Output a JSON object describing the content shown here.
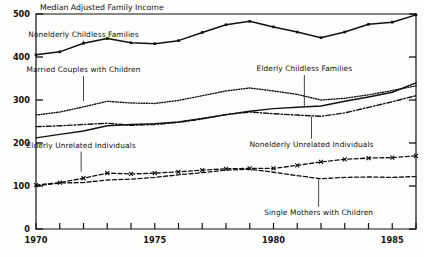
{
  "chart_data": {
    "type": "line",
    "title": "Median Adjusted Family Income",
    "xlabel": "",
    "ylabel": "",
    "xlim": [
      1970,
      1986
    ],
    "ylim": [
      0,
      500
    ],
    "grid": false,
    "legend": "inline-annotations",
    "yticks": [
      0,
      100,
      200,
      300,
      400,
      500
    ],
    "xticks": [
      1970,
      1971,
      1972,
      1973,
      1974,
      1975,
      1976,
      1977,
      1978,
      1979,
      1980,
      1981,
      1982,
      1983,
      1984,
      1985,
      1986
    ],
    "xtick_labels": [
      "1970",
      "1975",
      "1980",
      "1985"
    ],
    "xtick_labeled_years": [
      1970,
      1975,
      1980,
      1985
    ],
    "x": [
      1970,
      1971,
      1972,
      1973,
      1974,
      1975,
      1976,
      1977,
      1978,
      1979,
      1980,
      1981,
      1982,
      1983,
      1984,
      1985,
      1986
    ],
    "series": [
      {
        "name": "Nonelderly Childless Families",
        "style": "solid-markers",
        "color": "#111111",
        "values": [
          405,
          412,
          432,
          443,
          433,
          431,
          438,
          457,
          475,
          483,
          470,
          458,
          445,
          458,
          476,
          481,
          498
        ]
      },
      {
        "name": "Married Couples with Children",
        "style": "dotted",
        "color": "#111111",
        "values": [
          265,
          272,
          284,
          297,
          293,
          292,
          299,
          310,
          321,
          328,
          321,
          313,
          300,
          304,
          312,
          322,
          333
        ]
      },
      {
        "name": "Elderly Childless Families",
        "style": "solid",
        "color": "#111111",
        "values": [
          212,
          220,
          228,
          240,
          243,
          245,
          249,
          257,
          266,
          274,
          280,
          283,
          286,
          297,
          307,
          318,
          340
        ]
      },
      {
        "name": "Nonelderly Unrelated Individuals",
        "style": "dash-dot",
        "color": "#111111",
        "values": [
          238,
          240,
          243,
          246,
          241,
          243,
          248,
          256,
          266,
          272,
          268,
          265,
          262,
          270,
          283,
          296,
          310
        ]
      },
      {
        "name": "Elderly Unrelated Individuals",
        "style": "dashed-x",
        "color": "#111111",
        "values": [
          102,
          108,
          118,
          130,
          128,
          130,
          133,
          137,
          140,
          141,
          141,
          148,
          156,
          162,
          165,
          166,
          170
        ]
      },
      {
        "name": "Single Mothers with Children",
        "style": "dashed",
        "color": "#111111",
        "values": [
          100,
          107,
          108,
          114,
          116,
          120,
          126,
          131,
          137,
          139,
          132,
          124,
          117,
          120,
          121,
          120,
          122
        ]
      }
    ],
    "annotations": [
      {
        "text": "Nonelderly Childless Families",
        "x": 1972.0,
        "y_label": 452,
        "leader_to": 433,
        "leader": true
      },
      {
        "text": "Married Couples with Children",
        "x": 1972.0,
        "y_label": 370,
        "leader_to": 297,
        "leader": true
      },
      {
        "text": "Elderly Childless Families",
        "x": 1981.3,
        "y_label": 372,
        "leader_to": 283,
        "leader": true
      },
      {
        "text": "Elderly Unrelated Individuals",
        "x": 1971.9,
        "y_label": 194,
        "leader_to": 133,
        "leader": true
      },
      {
        "text": "Nonelderly Unrelated Individuals",
        "x": 1981.6,
        "y_label": 196,
        "leader_to": 262,
        "leader": true
      },
      {
        "text": "Single Mothers with Children",
        "x": 1981.9,
        "y_label": 38,
        "leader_to": 117,
        "leader": true
      }
    ]
  }
}
